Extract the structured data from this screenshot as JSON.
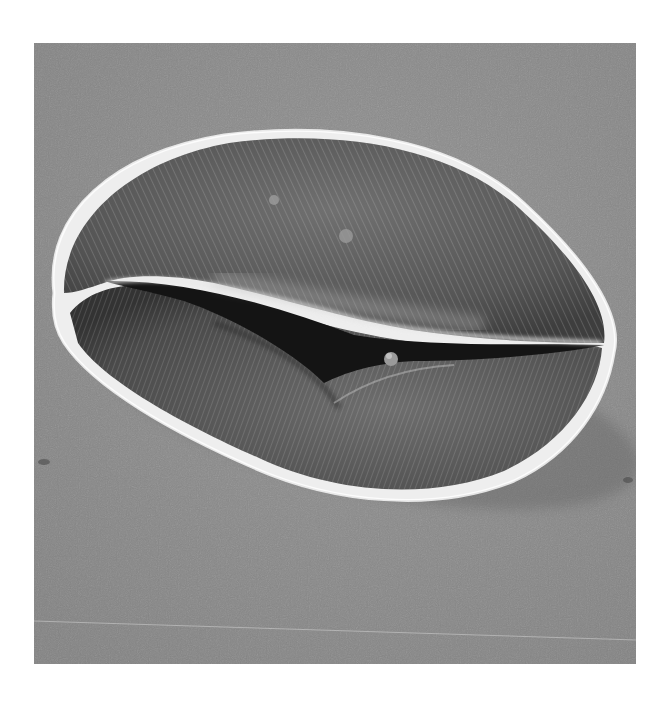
{
  "image": {
    "kind": "scanning electron micrograph",
    "subject": "pollen grain with longitudinal furrow (colpus)",
    "colors": {
      "page_background": "#ffffff",
      "substrate": "#8e8e8e",
      "grain_body": "#5a5a5a",
      "grain_rim": "#f2f2f2",
      "furrow": "#141414"
    }
  }
}
